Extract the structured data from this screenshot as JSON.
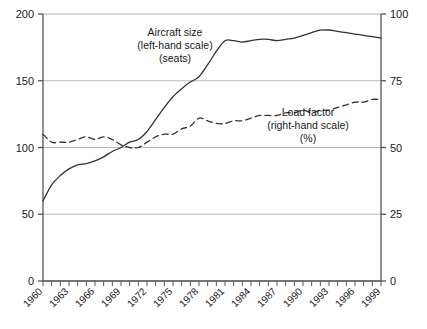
{
  "chart_data": {
    "type": "line",
    "title": "",
    "subtitle": "",
    "xlabel": "",
    "ylabel": "",
    "grid": true,
    "legend_position": "inline-annotation",
    "x": [
      1960,
      1961,
      1962,
      1963,
      1964,
      1965,
      1966,
      1967,
      1968,
      1969,
      1970,
      1971,
      1972,
      1973,
      1974,
      1975,
      1976,
      1977,
      1978,
      1979,
      1980,
      1981,
      1982,
      1983,
      1984,
      1985,
      1986,
      1987,
      1988,
      1989,
      1990,
      1991,
      1992,
      1993,
      1994,
      1995,
      1996,
      1997,
      1998,
      1999
    ],
    "axes": {
      "left": {
        "label": "Aircraft size (seats)",
        "min": 0,
        "max": 200,
        "ticks": [
          0,
          50,
          100,
          150,
          200
        ],
        "tick_labels": [
          "0",
          "50",
          "100",
          "150",
          "200"
        ]
      },
      "right": {
        "label": "Load factor (%)",
        "min": 0,
        "max": 100,
        "ticks": [
          0,
          25,
          50,
          75,
          100
        ],
        "tick_labels": [
          "0",
          "25",
          "50",
          "75",
          "100"
        ]
      },
      "x": {
        "min": 1960,
        "max": 1999,
        "tick_every": 1,
        "label_every": 3,
        "tick_labels": [
          "1960",
          "1963",
          "1966",
          "1969",
          "1972",
          "1975",
          "1978",
          "1981",
          "1984",
          "1987",
          "1990",
          "1993",
          "1996",
          "1999"
        ]
      }
    },
    "series": [
      {
        "name": "Aircraft size",
        "axis": "left",
        "unit": "seats",
        "style": "solid",
        "color": "#333333",
        "values": [
          60,
          72,
          79,
          84,
          87,
          88,
          90,
          93,
          97,
          100,
          104,
          106,
          112,
          121,
          130,
          138,
          144,
          149,
          153,
          162,
          172,
          180,
          180,
          179,
          180,
          181,
          181,
          180,
          181,
          182,
          184,
          186,
          188,
          188,
          187,
          186,
          185,
          184,
          183,
          182
        ]
      },
      {
        "name": "Load factor",
        "axis": "right",
        "unit": "%",
        "style": "dashed",
        "color": "#333333",
        "values": [
          55,
          52,
          52,
          52,
          53,
          54,
          53,
          54,
          53,
          51,
          50,
          50,
          52,
          54,
          55,
          55,
          57,
          58,
          61,
          60,
          59,
          59,
          60,
          60,
          61,
          62,
          62,
          62,
          63,
          63,
          64,
          63,
          64,
          64,
          65,
          66,
          67,
          67,
          68,
          68
        ]
      }
    ],
    "annotations": [
      {
        "id": "aircraft-size-annotation",
        "lines": [
          "Aircraft size",
          "(left-hand scale)",
          "(seats)"
        ],
        "x": 175,
        "y": 36
      },
      {
        "id": "load-factor-annotation",
        "lines": [
          "Load factor",
          "(right-hand scale)",
          "(%)"
        ],
        "x": 308,
        "y": 116
      }
    ],
    "colors": {
      "axis": "#555555",
      "gridline": "#b8b8b8",
      "series_line": "#333333",
      "text": "#1a1a1a",
      "background": "#ffffff"
    }
  }
}
